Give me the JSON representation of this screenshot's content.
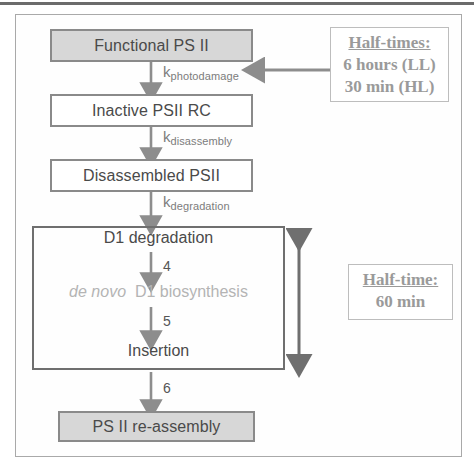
{
  "figure": {
    "title_text": "",
    "colors": {
      "shaded_box_fill": "#d7d7d7",
      "box_border": "#8a8a8a",
      "group_border": "#6f6f6f",
      "arrow": "#8d8d8d",
      "text": "#4a4a4a",
      "faded_text": "#b4b4b4",
      "callout_text": "#9a9a9a"
    }
  },
  "nodes": {
    "functional_psii": "Functional PS II",
    "inactive_psii_rc": "Inactive PSII RC",
    "disassembled_psii": "Disassembled PSII",
    "d1_degradation": "D1 degradation",
    "de_novo_italic": "de novo",
    "d1_biosynthesis": "D1 biosynthesis",
    "insertion": "Insertion",
    "psii_reassembly": "PS II re-assembly"
  },
  "rate_labels": {
    "k": "k",
    "photodamage": "photodamage",
    "disassembly": "disassembly",
    "degradation": "degradation"
  },
  "step_numbers": {
    "step4": "4",
    "step5": "5",
    "step6": "6"
  },
  "callouts": {
    "half_times": {
      "title": "Half-times:",
      "line1": "6 hours (LL)",
      "line2": "30 min (HL)"
    },
    "half_time": {
      "title": "Half-time:",
      "line1": "60 min"
    }
  }
}
